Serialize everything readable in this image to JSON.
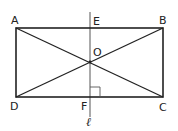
{
  "figure": {
    "type": "geometry-diagram",
    "colors": {
      "stroke": "#222222",
      "line_l": "#555555",
      "background": "#ffffff"
    },
    "points": {
      "A": {
        "label": "A",
        "x": 16,
        "y": 28
      },
      "B": {
        "label": "B",
        "x": 163,
        "y": 28
      },
      "C": {
        "label": "C",
        "x": 163,
        "y": 97
      },
      "D": {
        "label": "D",
        "x": 16,
        "y": 97
      },
      "E": {
        "label": "E",
        "x": 90,
        "y": 28
      },
      "F": {
        "label": "F",
        "x": 90,
        "y": 97
      },
      "O": {
        "label": "O",
        "x": 90,
        "y": 62
      }
    },
    "line": {
      "label": "ℓ"
    },
    "right_angle_marker": {
      "at": "F",
      "between": [
        "line ℓ",
        "FC"
      ]
    },
    "segments": [
      "AB",
      "BC",
      "CD",
      "DA",
      "AC",
      "BD"
    ]
  }
}
